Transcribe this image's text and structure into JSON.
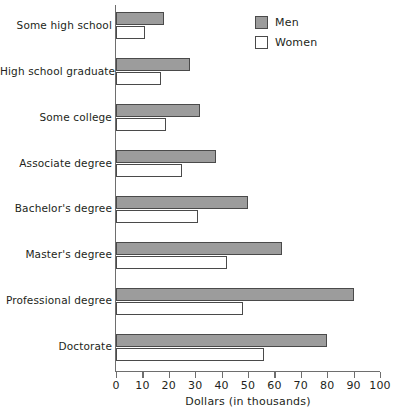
{
  "chart_data": {
    "type": "bar",
    "orientation": "horizontal",
    "title": "",
    "xlabel": "Dollars (in thousands)",
    "ylabel": "",
    "xlim": [
      0,
      100
    ],
    "xticks": [
      0,
      10,
      20,
      30,
      40,
      50,
      60,
      70,
      80,
      90,
      100
    ],
    "xtick_labels": [
      "0",
      "10",
      "20",
      "30",
      "40",
      "50",
      "60",
      "70",
      "80",
      "90",
      "100"
    ],
    "grid": false,
    "legend_position": "top-right",
    "categories": [
      "Some high school",
      "High school graduate",
      "Some college",
      "Associate degree",
      "Bachelor's degree",
      "Master's degree",
      "Professional degree",
      "Doctorate"
    ],
    "series": [
      {
        "name": "Men",
        "color": "#9c9c9c",
        "values": [
          18,
          28,
          32,
          38,
          50,
          63,
          90,
          80
        ]
      },
      {
        "name": "Women",
        "color": "#ffffff",
        "values": [
          11,
          17,
          19,
          25,
          31,
          42,
          48,
          56
        ]
      }
    ]
  },
  "legend": {
    "items": [
      {
        "label": "Men"
      },
      {
        "label": "Women"
      }
    ]
  },
  "colors": {
    "men_fill": "#9c9c9c",
    "women_fill": "#ffffff",
    "bar_stroke": "#4a4a4a",
    "axis": "#6e6e6e",
    "text": "#231f20"
  }
}
